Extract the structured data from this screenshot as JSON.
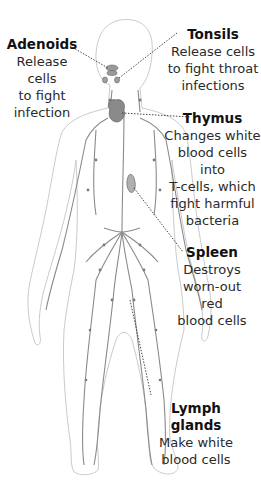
{
  "diagram": {
    "labels": [
      {
        "id": "adenoids",
        "title": "Adenoids",
        "desc": [
          "Release cells",
          "to fight",
          "infection"
        ]
      },
      {
        "id": "tonsils",
        "title": "Tonsils",
        "desc": [
          "Release cells",
          "to fight throat",
          "infections"
        ]
      },
      {
        "id": "thymus",
        "title": "Thymus",
        "desc": [
          "Changes white",
          "blood cells into",
          "T-cells, which",
          "fight harmful",
          "bacteria"
        ]
      },
      {
        "id": "spleen",
        "title": "Spleen",
        "desc": [
          "Destroys",
          "worn-out red",
          "blood cells"
        ]
      },
      {
        "id": "lymph-glands",
        "title": "Lymph glands",
        "desc": [
          "Make white",
          "blood cells"
        ]
      }
    ],
    "colors": {
      "outline": "#bdbdbd",
      "vessels": "#7a7a7a",
      "organs": "#8a8a8a",
      "leader": "#333333",
      "text": "#2a2a2a"
    }
  }
}
